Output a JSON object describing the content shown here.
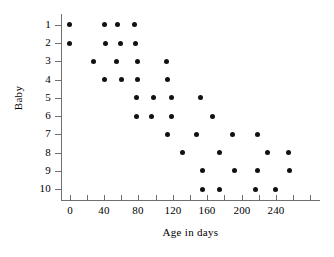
{
  "chart_data": {
    "type": "scatter",
    "title": "",
    "xlabel": "Age in days",
    "ylabel": "Baby",
    "xlim": [
      -10,
      290
    ],
    "ylim": [
      0.4,
      10.6
    ],
    "grid": false,
    "legend": "none",
    "x_ticks": [
      0,
      20,
      40,
      60,
      80,
      100,
      120,
      140,
      160,
      180,
      200,
      220,
      240,
      260,
      280
    ],
    "x_tick_labels": [
      "0",
      "",
      "40",
      "",
      "80",
      "",
      "120",
      "",
      "160",
      "",
      "200",
      "",
      "240",
      "",
      ""
    ],
    "x_major_ticks": [
      0,
      40,
      80,
      120,
      160,
      200,
      240
    ],
    "y_ticks": [
      1,
      2,
      3,
      4,
      5,
      6,
      7,
      8,
      9,
      10
    ],
    "y_tick_labels": [
      "1",
      "2",
      "3",
      "4",
      "5",
      "6",
      "7",
      "8",
      "9",
      "10"
    ],
    "marker": "filled-circle",
    "marker_color": "#111111",
    "marker_size": 5,
    "points": [
      {
        "x": 0,
        "y": 1
      },
      {
        "x": 40,
        "y": 1
      },
      {
        "x": 56,
        "y": 1
      },
      {
        "x": 75,
        "y": 1
      },
      {
        "x": 0,
        "y": 2
      },
      {
        "x": 42,
        "y": 2
      },
      {
        "x": 59,
        "y": 2
      },
      {
        "x": 77,
        "y": 2
      },
      {
        "x": 28,
        "y": 3
      },
      {
        "x": 55,
        "y": 3
      },
      {
        "x": 79,
        "y": 3
      },
      {
        "x": 113,
        "y": 3
      },
      {
        "x": 41,
        "y": 4
      },
      {
        "x": 60,
        "y": 4
      },
      {
        "x": 79,
        "y": 4
      },
      {
        "x": 114,
        "y": 4
      },
      {
        "x": 78,
        "y": 5
      },
      {
        "x": 97,
        "y": 5
      },
      {
        "x": 118,
        "y": 5
      },
      {
        "x": 152,
        "y": 5
      },
      {
        "x": 78,
        "y": 6
      },
      {
        "x": 95,
        "y": 6
      },
      {
        "x": 119,
        "y": 6
      },
      {
        "x": 166,
        "y": 6
      },
      {
        "x": 114,
        "y": 7
      },
      {
        "x": 148,
        "y": 7
      },
      {
        "x": 189,
        "y": 7
      },
      {
        "x": 218,
        "y": 7
      },
      {
        "x": 131,
        "y": 8
      },
      {
        "x": 174,
        "y": 8
      },
      {
        "x": 230,
        "y": 8
      },
      {
        "x": 255,
        "y": 8
      },
      {
        "x": 154,
        "y": 9
      },
      {
        "x": 192,
        "y": 9
      },
      {
        "x": 218,
        "y": 9
      },
      {
        "x": 256,
        "y": 9
      },
      {
        "x": 154,
        "y": 10
      },
      {
        "x": 174,
        "y": 10
      },
      {
        "x": 216,
        "y": 10
      },
      {
        "x": 239,
        "y": 10
      }
    ]
  }
}
